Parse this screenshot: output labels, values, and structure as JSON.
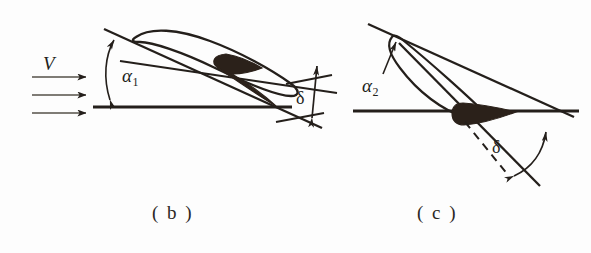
{
  "figure": {
    "background_color": "#fdfdfd",
    "ink_color": "#241f1b",
    "fill_color": "#2b211a",
    "panels": [
      {
        "id": "panel-b",
        "caption": "( b )",
        "description": "Airfoil cascade blade at inlet angle alpha-1 with uniform oncoming flow V and deviation angle delta at trailing edge",
        "labels": {
          "velocity": "V",
          "angle_alpha": "α",
          "angle_alpha_sub": "1",
          "angle_delta": "δ"
        },
        "flow_arrows": 3
      },
      {
        "id": "panel-c",
        "caption": "( c )",
        "description": "Slender blade profile at inlet angle alpha-2 with deviation angle delta between dashed chord and trailing line",
        "labels": {
          "angle_alpha": "α",
          "angle_alpha_sub": "2",
          "angle_delta": "δ"
        },
        "flow_arrows": 0
      }
    ]
  }
}
